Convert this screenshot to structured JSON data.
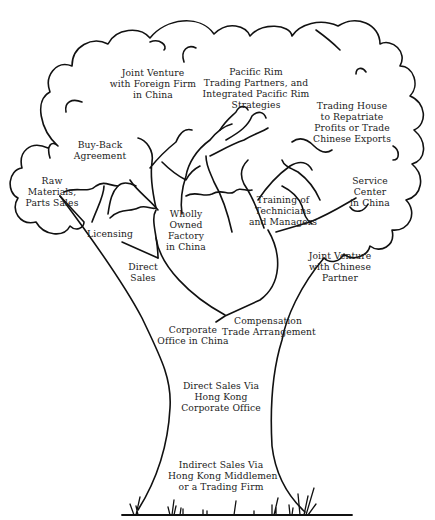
{
  "diagram": {
    "type": "tree",
    "description_colors": {
      "line": "#111111",
      "background": "#ffffff",
      "text": "#222222"
    },
    "labels": [
      {
        "id": "jv-foreign",
        "lines": [
          "Joint Venture",
          "with Foreign Firm",
          "in China"
        ]
      },
      {
        "id": "pacific-rim",
        "lines": [
          "Pacific Rim",
          "Trading Partners, and",
          "Integrated Pacific Rim",
          "Strategies"
        ]
      },
      {
        "id": "trading-house",
        "lines": [
          "Trading House",
          "to Repatriate",
          "Profits or Trade",
          "Chinese Exports"
        ]
      },
      {
        "id": "buy-back",
        "lines": [
          "Buy-Back",
          "Agreement"
        ]
      },
      {
        "id": "raw-materials",
        "lines": [
          "Raw",
          "Materials,",
          "Parts Sales"
        ]
      },
      {
        "id": "service-center",
        "lines": [
          "Service",
          "Center",
          "in China"
        ]
      },
      {
        "id": "licensing",
        "lines": [
          "Licensing"
        ]
      },
      {
        "id": "wholly-owned",
        "lines": [
          "Wholly",
          "Owned",
          "Factory",
          "in China"
        ]
      },
      {
        "id": "training",
        "lines": [
          "Training of",
          "Technicians",
          "and Managers"
        ]
      },
      {
        "id": "direct-sales",
        "lines": [
          "Direct",
          "Sales"
        ]
      },
      {
        "id": "jv-chinese",
        "lines": [
          "Joint Venture",
          "with Chinese",
          "Partner"
        ]
      },
      {
        "id": "compensation",
        "lines": [
          "Compensation",
          "Trade Arrangement"
        ]
      },
      {
        "id": "corporate-office",
        "lines": [
          "Corporate",
          "Office in China"
        ]
      },
      {
        "id": "direct-sales-hk",
        "lines": [
          "Direct Sales Via",
          "Hong Kong",
          "Corporate Office"
        ]
      },
      {
        "id": "indirect-sales",
        "lines": [
          "Indirect Sales Via",
          "Hong Kong Middlemen",
          "or a Trading Firm"
        ]
      }
    ]
  }
}
